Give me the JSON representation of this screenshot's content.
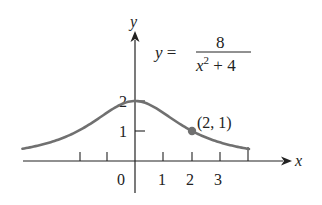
{
  "chart_data": {
    "type": "line",
    "title": "",
    "equation": {
      "lhs": "y =",
      "numerator": "8",
      "denominator_base": "x",
      "denominator_exp": "2",
      "denominator_rest": " + 4"
    },
    "xlabel": "x",
    "ylabel": "y",
    "function": "8/(x^2+4)",
    "xlim": [
      -3.95,
      4
    ],
    "ylim": [
      0,
      2
    ],
    "grid": false,
    "x_ticks": [
      -2,
      -1,
      0,
      1,
      2,
      3,
      4
    ],
    "x_tick_labels": [
      "",
      "",
      "0",
      "1",
      "2",
      "3",
      ""
    ],
    "y_ticks": [
      1,
      2
    ],
    "y_tick_labels": [
      "1",
      "2"
    ],
    "series": [
      {
        "name": "y = 8/(x^2+4)",
        "x": [
          -3.93,
          -3,
          -2,
          -1,
          0,
          1,
          2,
          3,
          4
        ],
        "values": [
          0.41,
          0.62,
          1.0,
          1.6,
          2.0,
          1.6,
          1.0,
          0.62,
          0.4
        ],
        "color": "#707070"
      }
    ],
    "annotations": [
      {
        "x": 2,
        "y": 1,
        "label": "(2, 1)",
        "marker": "dot"
      }
    ]
  },
  "labels": {
    "origin": "0",
    "x1": "1",
    "x2": "2",
    "x3": "3",
    "y1": "1",
    "y2": "2",
    "x_axis": "x",
    "y_axis": "y",
    "point": "(2, 1)",
    "eq_lhs": "y =",
    "eq_num": "8",
    "eq_den_base": "x",
    "eq_den_exp": "2",
    "eq_den_rest": " + 4"
  },
  "colors": {
    "curve": "#707070",
    "axes": "#222222"
  }
}
